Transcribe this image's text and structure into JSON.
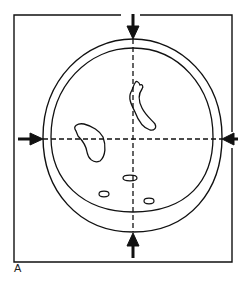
{
  "figure": {
    "panel_label": "A",
    "colors": {
      "line": "#111111",
      "background": "#ffffff"
    },
    "elements": {
      "frame": "rectangular-frame",
      "skull_outer": "outer-skull-contour",
      "skull_inner": "inner-skull-contour",
      "vertical_line": "dashed-midline-vertical",
      "horizontal_line": "dashed-line-horizontal",
      "arrows": [
        "arrow-top",
        "arrow-bottom",
        "arrow-left",
        "arrow-right"
      ],
      "lesions": [
        "lesion-left-large",
        "lesion-right-curved",
        "lesion-small-center",
        "lesion-small-left",
        "lesion-small-right"
      ]
    }
  }
}
